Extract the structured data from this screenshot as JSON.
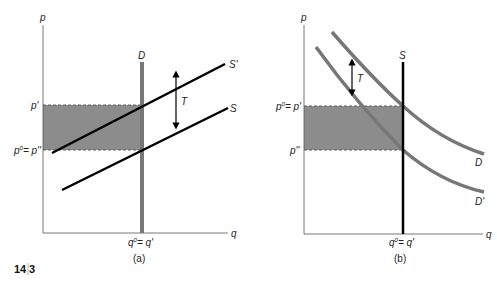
{
  "figure_number": {
    "chapter": "14",
    "index": "3"
  },
  "colors": {
    "shade": "#8c8c8c",
    "demand_gray": "#777777",
    "line_black": "#000000",
    "axis": "#555555"
  },
  "panels": [
    {
      "caption": "(a)",
      "axis_labels": {
        "y": "p",
        "x": "q"
      },
      "price_labels": {
        "upper": "p'",
        "lower_left": "p",
        "lower_sup": "0",
        "lower_right": "= p''"
      },
      "quantity_label": {
        "base": "q",
        "sup": "0",
        "rest": "= q'"
      },
      "curves": {
        "demand": "D",
        "supply_shifted": "S'",
        "supply": "S"
      },
      "tax_label": "T"
    },
    {
      "caption": "(b)",
      "axis_labels": {
        "y": "p",
        "x": "q"
      },
      "price_labels": {
        "upper_left": "p",
        "upper_sup": "0",
        "upper_right": "= p'",
        "lower": "p''"
      },
      "quantity_label": {
        "base": "q",
        "sup": "0",
        "rest": "= q'"
      },
      "curves": {
        "supply": "S",
        "demand": "D",
        "demand_shifted": "D'"
      },
      "tax_label": "T"
    }
  ]
}
